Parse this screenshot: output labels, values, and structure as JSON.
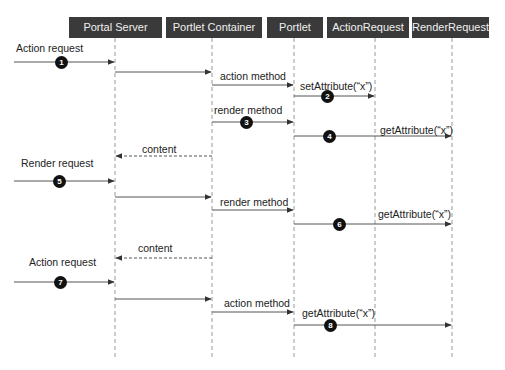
{
  "diagram": {
    "type": "sequence",
    "participants": [
      {
        "id": "portal_server",
        "label": "Portal Server",
        "x": 115,
        "box": [
          69,
          162
        ]
      },
      {
        "id": "portlet_container",
        "label": "Portlet Container",
        "x": 212,
        "box": [
          166,
          262
        ]
      },
      {
        "id": "portlet",
        "label": "Portlet",
        "x": 294,
        "box": [
          267,
          323
        ]
      },
      {
        "id": "action_request",
        "label": "ActionRequest",
        "x": 375,
        "box": [
          327,
          409
        ]
      },
      {
        "id": "render_request",
        "label": "RenderRequest",
        "x": 452,
        "box": [
          412,
          489
        ]
      }
    ],
    "messages": [
      {
        "from": "external",
        "to": "portal_server",
        "label": "Action request",
        "step": "1",
        "style": "solid"
      },
      {
        "from": "portal_server",
        "to": "portlet_container",
        "label": "",
        "step": "",
        "style": "solid"
      },
      {
        "from": "portlet_container",
        "to": "portlet",
        "label": "action method",
        "step": "",
        "style": "solid"
      },
      {
        "from": "portlet",
        "to": "action_request",
        "label": "setAttribute(“x”)",
        "step": "2",
        "style": "solid"
      },
      {
        "from": "portlet_container",
        "to": "portlet",
        "label": "render method",
        "step": "3",
        "style": "solid"
      },
      {
        "from": "portlet",
        "to": "render_request",
        "label": "getAttribute(“x”)",
        "step": "4",
        "style": "solid"
      },
      {
        "from": "portlet_container",
        "to": "portal_server",
        "label": "content",
        "step": "",
        "style": "dashed"
      },
      {
        "from": "external",
        "to": "portal_server",
        "label": "Render request",
        "step": "5",
        "style": "solid"
      },
      {
        "from": "portal_server",
        "to": "portlet_container",
        "label": "",
        "step": "",
        "style": "solid"
      },
      {
        "from": "portlet_container",
        "to": "portlet",
        "label": "render method",
        "step": "",
        "style": "solid"
      },
      {
        "from": "portlet",
        "to": "render_request",
        "label": "getAttribute(“x”)",
        "step": "6",
        "style": "solid"
      },
      {
        "from": "portlet_container",
        "to": "portal_server",
        "label": "content",
        "step": "",
        "style": "dashed"
      },
      {
        "from": "external",
        "to": "portal_server",
        "label": "Action request",
        "step": "7",
        "style": "solid"
      },
      {
        "from": "portal_server",
        "to": "portlet_container",
        "label": "",
        "step": "",
        "style": "solid"
      },
      {
        "from": "portlet_container",
        "to": "portlet",
        "label": "action method",
        "step": "",
        "style": "solid"
      },
      {
        "from": "portlet",
        "to": "render_request",
        "label": "getAttribute(“x”)",
        "step": "8",
        "style": "solid"
      }
    ]
  },
  "layout": {
    "rows": [
      {
        "y": 62,
        "x1": 14,
        "x2": 115,
        "label_x": 16,
        "label_y": 42,
        "badge_x": 61
      },
      {
        "y": 72,
        "x1": 115,
        "x2": 212
      },
      {
        "y": 85,
        "x1": 212,
        "x2": 294,
        "label_x": 220,
        "label_y": 70
      },
      {
        "y": 96,
        "x1": 294,
        "x2": 375,
        "label_x": 300,
        "label_y": 80,
        "badge_x": 327
      },
      {
        "y": 122,
        "x1": 212,
        "x2": 294,
        "label_x": 214,
        "label_y": 104,
        "badge_x": 246
      },
      {
        "y": 136,
        "x1": 294,
        "x2": 452,
        "label_x": 380,
        "label_y": 124,
        "badge_x": 329
      },
      {
        "y": 156,
        "x1": 212,
        "x2": 115,
        "label_x": 142,
        "label_y": 143
      },
      {
        "y": 181,
        "x1": 14,
        "x2": 115,
        "label_x": 21,
        "label_y": 157,
        "badge_x": 59
      },
      {
        "y": 197,
        "x1": 115,
        "x2": 212
      },
      {
        "y": 210,
        "x1": 212,
        "x2": 294,
        "label_x": 220,
        "label_y": 196
      },
      {
        "y": 224,
        "x1": 294,
        "x2": 452,
        "label_x": 378,
        "label_y": 208,
        "badge_x": 339
      },
      {
        "y": 258,
        "x1": 212,
        "x2": 115,
        "label_x": 138,
        "label_y": 242
      },
      {
        "y": 282,
        "x1": 14,
        "x2": 115,
        "label_x": 29,
        "label_y": 256,
        "badge_x": 60
      },
      {
        "y": 299,
        "x1": 115,
        "x2": 212
      },
      {
        "y": 312,
        "x1": 212,
        "x2": 294,
        "label_x": 224,
        "label_y": 297
      },
      {
        "y": 325,
        "x1": 294,
        "x2": 452,
        "label_x": 302,
        "label_y": 307,
        "badge_x": 330
      }
    ],
    "lifeline_top": 38,
    "lifeline_bottom": 357,
    "colors": {
      "header_bg": "#3a3a3a",
      "header_text": "#f0f0f0",
      "line": "#555555",
      "badge": "#111111"
    }
  }
}
